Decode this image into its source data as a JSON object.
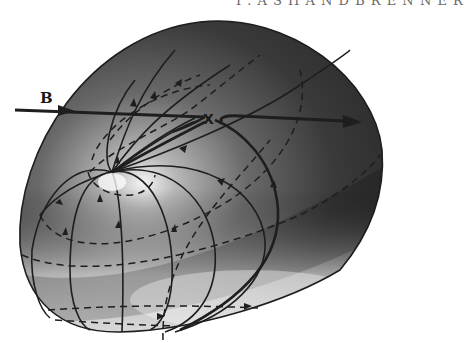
{
  "figure": {
    "type": "3D field-line topology diagram",
    "header_fragment": "I . A S H A N D B R E N N E R",
    "labels": {
      "field": "B",
      "x_point": "X"
    },
    "colors": {
      "surface_dark": "#2b2b2b",
      "surface_mid": "#6e6e6e",
      "surface_light": "#e8e8e8",
      "line": "#1e1e1e",
      "background": "#ffffff"
    }
  }
}
